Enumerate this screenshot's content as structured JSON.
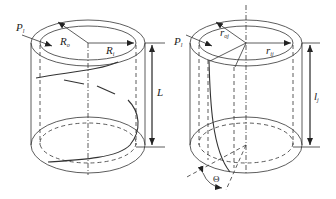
{
  "figure": {
    "left_cylinder": {
      "name": "helical-cylinder",
      "labels": {
        "P": "P",
        "P_sub": "l",
        "Ro": "R",
        "Ro_sub": "o",
        "Ri": "R",
        "Ri_sub": "i",
        "L": "L"
      }
    },
    "right_cylinder": {
      "name": "skewed-cylinder",
      "labels": {
        "P": "P",
        "P_sub": "l",
        "roj": "r",
        "roj_sub": "oj",
        "rij": "r",
        "rij_sub": "ij",
        "l": "l",
        "l_sub": "j",
        "theta": "Θ"
      }
    },
    "colors": {
      "stroke": "#333333",
      "background": "#ffffff"
    }
  }
}
